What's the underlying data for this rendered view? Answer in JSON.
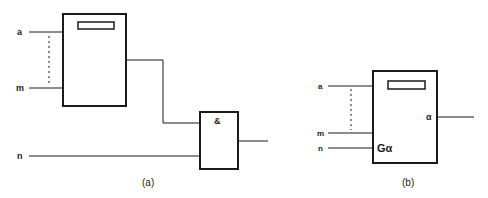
{
  "diagram_a": {
    "caption": "(a)",
    "inputs": {
      "first": "a",
      "last": "m",
      "extra": "n"
    },
    "and_gate_label": "&"
  },
  "diagram_b": {
    "caption": "(b)",
    "inputs": {
      "first": "a",
      "last": "m",
      "gate": "n"
    },
    "gate_label": "Gα",
    "output_label": "α"
  },
  "colors": {
    "stroke": "#1a1a1a",
    "background": "#ffffff"
  }
}
